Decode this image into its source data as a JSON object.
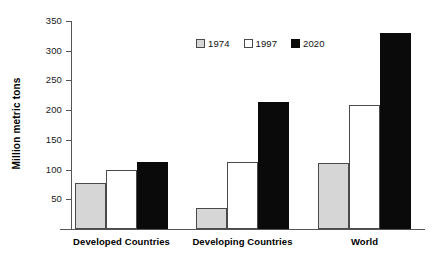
{
  "chart_data": {
    "type": "bar",
    "title": "",
    "xlabel": "",
    "ylabel": "Million metric tons",
    "categories": [
      "Developed Countries",
      "Developing Countries",
      "World"
    ],
    "series": [
      {
        "name": "1974",
        "color": "#d6d6d6",
        "values": [
          78,
          35,
          111
        ]
      },
      {
        "name": "1997",
        "color": "#ffffff",
        "values": [
          100,
          112,
          208
        ]
      },
      {
        "name": "2020",
        "color": "#0a0a0a",
        "values": [
          113,
          213,
          330
        ]
      }
    ],
    "ylim": [
      0,
      350
    ],
    "yticks": [
      50,
      100,
      150,
      200,
      250,
      300,
      350
    ],
    "ytick_labels": [
      "50",
      "100",
      "150",
      "200",
      "250",
      "300",
      "350"
    ],
    "grid": false,
    "legend_position": "top-center",
    "legend_entries": [
      "1974",
      "1997",
      "2020"
    ],
    "axis_color": "#555555",
    "bar_outline_color": "#4a4a4a"
  }
}
